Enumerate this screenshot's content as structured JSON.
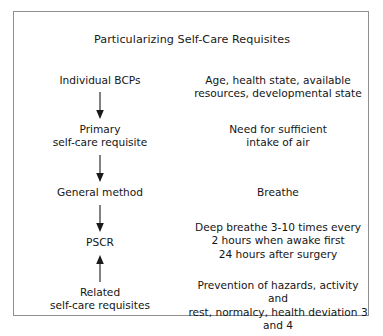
{
  "figure": {
    "title": "Particularizing Self-Care Requisites",
    "border_color": "#8f8f8f",
    "background_color": "#ffffff",
    "text_color": "#151515"
  },
  "flow": {
    "nodes": [
      {
        "id": "individual-bcps",
        "label": "Individual BCPs"
      },
      {
        "id": "primary-self-care-requisite",
        "label": "Primary\nself-care requisite"
      },
      {
        "id": "general-method",
        "label": "General method"
      },
      {
        "id": "pscr",
        "label": "PSCR"
      },
      {
        "id": "related-self-care-requisites",
        "label": "Related\nself-care requisites"
      }
    ],
    "arrows": [
      {
        "id": "arrow-bcps-to-primary",
        "from": "individual-bcps",
        "to": "primary-self-care-requisite",
        "direction": "down"
      },
      {
        "id": "arrow-primary-to-method",
        "from": "primary-self-care-requisite",
        "to": "general-method",
        "direction": "down"
      },
      {
        "id": "arrow-method-to-pscr",
        "from": "general-method",
        "to": "pscr",
        "direction": "down"
      },
      {
        "id": "arrow-related-to-pscr",
        "from": "related-self-care-requisites",
        "to": "pscr",
        "direction": "up"
      }
    ]
  },
  "examples": [
    {
      "id": "example-bcps",
      "text": "Age, health state, available\nresources, developmental state"
    },
    {
      "id": "example-primary",
      "text": "Need for sufficient\nintake of air"
    },
    {
      "id": "example-method",
      "text": "Breathe"
    },
    {
      "id": "example-pscr",
      "text": "Deep breathe 3-10 times every\n2 hours when awake first\n24 hours after surgery"
    },
    {
      "id": "example-related",
      "text": "Prevention of hazards, activity and\nrest, normalcy, health deviation 3\nand 4"
    }
  ]
}
